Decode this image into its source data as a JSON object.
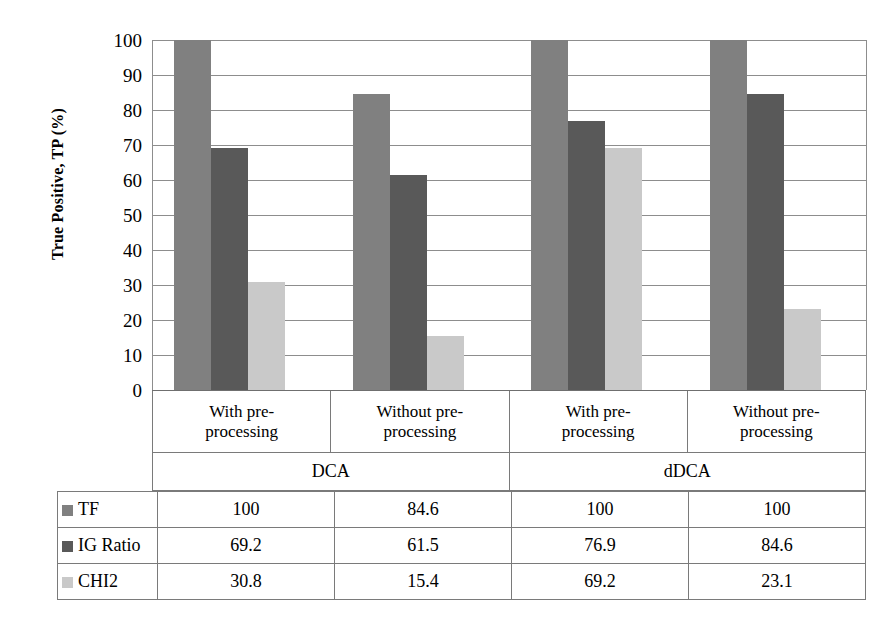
{
  "chart_data": {
    "type": "bar",
    "title": "",
    "xlabel": "",
    "ylabel": "True Positive, TP (%)",
    "ylim": [
      0,
      100
    ],
    "ytick_step": 10,
    "yticks": [
      100,
      90,
      80,
      70,
      60,
      50,
      40,
      30,
      20,
      10,
      0
    ],
    "grid": true,
    "legend_position": "table-left",
    "categories": [
      "With pre-processing",
      "Without pre-processing",
      "With pre-processing",
      "Without pre-processing"
    ],
    "category_lines": [
      [
        "With pre-",
        "processing"
      ],
      [
        "Without pre-",
        "processing"
      ],
      [
        "With pre-",
        "processing"
      ],
      [
        "Without pre-",
        "processing"
      ]
    ],
    "super_categories": [
      {
        "label": "DCA",
        "span": 2
      },
      {
        "label": "dDCA",
        "span": 2
      }
    ],
    "series": [
      {
        "name": "TF",
        "color": "#808080",
        "values": [
          100,
          84.6,
          100,
          100
        ]
      },
      {
        "name": "IG Ratio",
        "color": "#595959",
        "values": [
          69.2,
          61.5,
          76.9,
          84.6
        ]
      },
      {
        "name": "CHI2",
        "color": "#c9c9c9",
        "values": [
          30.8,
          15.4,
          69.2,
          23.1
        ]
      }
    ]
  },
  "table": {
    "rows": [
      {
        "label": "TF",
        "swatch": "#808080",
        "values": [
          "100",
          "84.6",
          "100",
          "100"
        ]
      },
      {
        "label": "IG Ratio",
        "swatch": "#595959",
        "values": [
          "69.2",
          "61.5",
          "76.9",
          "84.6"
        ]
      },
      {
        "label": "CHI2",
        "swatch": "#c9c9c9",
        "values": [
          "30.8",
          "15.4",
          "69.2",
          "23.1"
        ]
      }
    ]
  },
  "colors": {
    "tf": "#808080",
    "ig_ratio": "#595959",
    "chi2": "#c9c9c9",
    "gridline": "#8d8d8d",
    "border": "#7a7a7a"
  }
}
